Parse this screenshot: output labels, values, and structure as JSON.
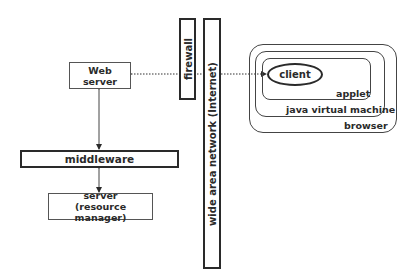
{
  "diagram": {
    "nodes": {
      "web_server": {
        "line1": "Web",
        "line2": "server"
      },
      "firewall": {
        "label": "firewall"
      },
      "wan": {
        "label": "wide area network (Internet)"
      },
      "middleware": {
        "label": "middleware"
      },
      "server": {
        "line1": "server",
        "line2": "(resource manager)"
      },
      "client": {
        "label": "client"
      },
      "applet": {
        "label": "applet"
      },
      "jvm": {
        "label": "java virtual machine"
      },
      "browser": {
        "label": "browser"
      }
    },
    "edges": [
      {
        "from": "web_server",
        "to": "client",
        "style": "dotted",
        "direction": "both"
      },
      {
        "from": "web_server",
        "to": "middleware",
        "style": "solid",
        "direction": "both"
      },
      {
        "from": "middleware",
        "to": "server",
        "style": "solid",
        "direction": "both"
      }
    ],
    "colors": {
      "stroke": "#2a2a2a",
      "background": "#ffffff"
    }
  }
}
